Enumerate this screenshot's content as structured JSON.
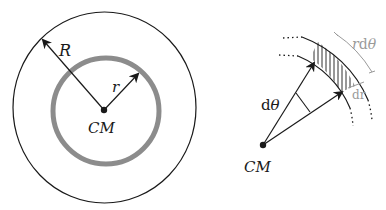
{
  "figure_left": {
    "outer_radius_label": "R",
    "inner_radius_label": "r",
    "center_label": "CM"
  },
  "figure_right": {
    "angle_label": "d",
    "angle_symbol": "θ",
    "center_label": "CM",
    "arc_length_label_r": "r",
    "arc_length_label_d": "d",
    "arc_length_label_theta": "θ",
    "thickness_label": "dr"
  },
  "colors": {
    "line": "#1a1a1a",
    "ring": "#8c8c8c",
    "annotation": "#9a9a9a"
  }
}
